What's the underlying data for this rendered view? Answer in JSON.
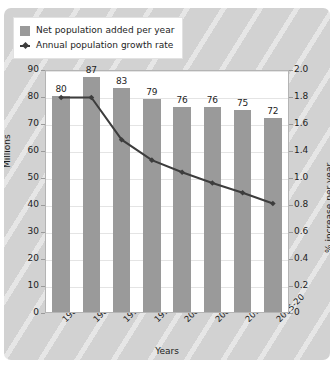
{
  "legend": {
    "items": [
      {
        "label": "Net population added per year",
        "marker": "bar-swatch-icon",
        "color": "#9a9a9a"
      },
      {
        "label": "Annual population growth rate",
        "marker": "line-marker-icon",
        "color": "#3d3d3d"
      }
    ]
  },
  "axes": {
    "left_title": "Millions",
    "right_title": "% increase per year",
    "x_title": "Years",
    "left_ticks": [
      "90",
      "80",
      "70",
      "60",
      "50",
      "40",
      "30",
      "20",
      "10",
      "0"
    ],
    "right_ticks": [
      "2.0",
      "1.8",
      "1.6",
      "1.4",
      "1.0",
      "0.8",
      "0.6",
      "0.4",
      "0.2",
      "0"
    ]
  },
  "chart_data": {
    "type": "bar",
    "title": "",
    "xlabel": "Years",
    "ylabel": "Millions",
    "y2label": "% increase per year",
    "categories": [
      "1980-85",
      "1985-90",
      "1990-95",
      "1995-2000",
      "2000-05",
      "2005-10",
      "2010-15",
      "2015-20"
    ],
    "ylim": [
      0,
      90
    ],
    "y2lim": [
      0,
      2.0
    ],
    "grid": true,
    "legend_position": "top-left",
    "series": [
      {
        "name": "Net population added per year",
        "type": "bar",
        "axis": "left",
        "unit": "Millions",
        "color": "#9a9a9a",
        "values": [
          80,
          87,
          83,
          79,
          76,
          76,
          75,
          72
        ],
        "labels": [
          "80",
          "87",
          "83",
          "79",
          "76",
          "76",
          "75",
          "72"
        ]
      },
      {
        "name": "Annual population growth rate",
        "type": "line",
        "axis": "right",
        "unit": "% increase per year",
        "color": "#3d3d3d",
        "values": [
          1.78,
          1.78,
          1.43,
          1.26,
          1.16,
          1.07,
          0.99,
          0.9
        ]
      }
    ]
  },
  "style": {
    "panel_background": "#d2d2d2",
    "plot_background": "#ffffff",
    "gridline_color": "#e4e4e4",
    "bar_color": "#9a9a9a",
    "line_color": "#3d3d3d",
    "text_color": "#1d1d1d"
  }
}
